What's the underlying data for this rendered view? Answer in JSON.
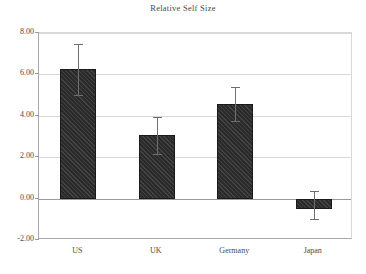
{
  "chart_data": {
    "type": "bar",
    "title": "Relative Self Size",
    "xlabel": "",
    "ylabel": "",
    "categories": [
      "US",
      "UK",
      "Germany",
      "Japan"
    ],
    "values": [
      6.24,
      3.05,
      4.57,
      -0.48
    ],
    "errors": [
      1.25,
      0.9,
      0.81,
      0.76
    ],
    "error_upper": [
      7.48,
      3.95,
      5.38,
      0.38
    ],
    "error_lower": [
      5.0,
      2.14,
      3.76,
      -1.0
    ],
    "ylim": [
      -2.0,
      8.0
    ],
    "ytick_labels": [
      "8.00",
      "6.00",
      "4.00",
      "2.00",
      "0.00",
      "-2.00"
    ],
    "ytick_values": [
      8,
      6,
      4,
      2,
      0,
      -2
    ],
    "grid": true,
    "legend": "none",
    "bar_color": "#2b2b2b",
    "bar_pattern": "diagonal-hatch",
    "error_color": "#6f6f6f",
    "gridline_color": "#d9d9d9",
    "axis_color": "#a9a9a9",
    "background": "#ffffff"
  },
  "axis": {
    "yticks": [
      {
        "label": "8.00",
        "value": 8
      },
      {
        "label": "6.00",
        "value": 6
      },
      {
        "label": "4.00",
        "value": 4
      },
      {
        "label": "2.00",
        "value": 2
      },
      {
        "label": "0.00",
        "value": 0
      },
      {
        "label": "-2.00",
        "value": -2
      }
    ],
    "xticks": [
      {
        "label": "US"
      },
      {
        "label": "UK"
      },
      {
        "label": "Germany"
      },
      {
        "label": "Japan"
      }
    ]
  }
}
